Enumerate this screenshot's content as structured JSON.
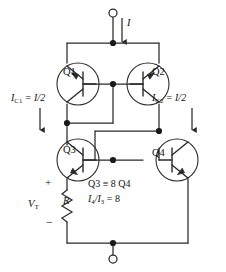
{
  "figure": {
    "type": "circuit-schematic",
    "width": 226,
    "height": 272,
    "line_color": "#2b2b2b",
    "text_color": "#111111",
    "background": "#ffffff"
  },
  "transistors": [
    {
      "id": "Q1",
      "label": "Q1",
      "device": "pnp",
      "orientation": "normal"
    },
    {
      "id": "Q2",
      "label": "Q2",
      "device": "pnp",
      "orientation": "mirrored"
    },
    {
      "id": "Q3",
      "label": "Q3",
      "device": "npn",
      "orientation": "normal"
    },
    {
      "id": "Q4",
      "label": "Q4",
      "device": "npn",
      "orientation": "mirrored"
    }
  ],
  "labels": {
    "supply_current": "I",
    "current_left_name": "I",
    "current_left_sub": "C1",
    "current_left_value": "= I/2",
    "current_right_name": "I",
    "current_right_sub": "C2",
    "current_right_value": "= I/2",
    "vt_name": "V",
    "vt_sub": "T",
    "resistor": "R",
    "polarity_plus": "+",
    "polarity_minus": "−",
    "note_device_ratio": "Q3 ≡ 8 Q4",
    "note_current_ratio_num": "I",
    "note_current_ratio_num_sub": "4",
    "note_current_ratio_den": "/I",
    "note_current_ratio_den_sub": "3",
    "note_current_ratio_eq": "= 8"
  },
  "terminals": [
    {
      "name": "top-terminal",
      "kind": "open-circle",
      "x": 113,
      "y": 12
    },
    {
      "name": "bottom-terminal",
      "kind": "open-circle",
      "x": 113,
      "y": 260
    }
  ],
  "nodes": [
    {
      "name": "top-supply-node",
      "x": 113,
      "y": 43
    },
    {
      "name": "base-bus-node",
      "x": 113,
      "y": 84
    },
    {
      "name": "q1-collector-node",
      "x": 67,
      "y": 123
    },
    {
      "name": "q2-collector-node",
      "x": 159,
      "y": 131
    },
    {
      "name": "q3q4-base-node",
      "x": 113,
      "y": 160
    },
    {
      "name": "bottom-rail-node",
      "x": 113,
      "y": 243
    }
  ]
}
